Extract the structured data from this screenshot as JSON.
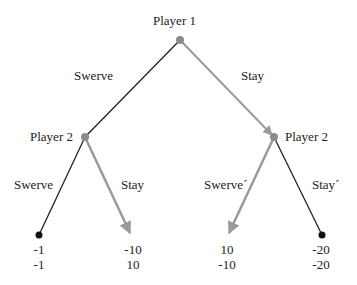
{
  "diagram": {
    "type": "extensive-form game tree",
    "nodes": {
      "root": {
        "label": "Player 1"
      },
      "left": {
        "label": "Player 2"
      },
      "right": {
        "label": "Player 2"
      }
    },
    "edges": {
      "root_left": {
        "label": "Swerve",
        "highlighted": false
      },
      "root_right": {
        "label": "Stay",
        "highlighted": true
      },
      "left_swerve": {
        "label": "Swerve",
        "highlighted": false
      },
      "left_stay": {
        "label": "Stay",
        "highlighted": true
      },
      "right_swerve": {
        "label": "Swerve´",
        "highlighted": true
      },
      "right_stay": {
        "label": "Stay´",
        "highlighted": false
      }
    },
    "payoffs": [
      {
        "p1": "-1",
        "p2": "-1"
      },
      {
        "p1": "-10",
        "p2": "10"
      },
      {
        "p1": "10",
        "p2": "-10"
      },
      {
        "p1": "-20",
        "p2": "-20"
      }
    ],
    "colors": {
      "line": "#222222",
      "highlight": "#9a9a9a",
      "node": "#8c8c8c",
      "leaf": "#111111"
    }
  }
}
